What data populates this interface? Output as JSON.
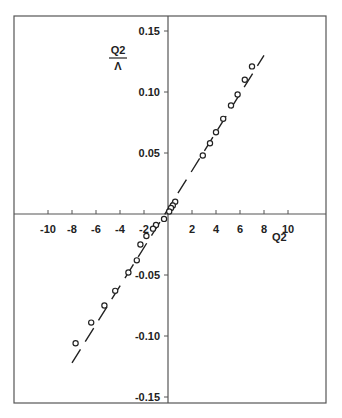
{
  "chart_data": {
    "type": "scatter",
    "title": "",
    "xlabel": "Q2",
    "ylabel": "Q2 / Λ",
    "ylabel_numerator": "Q2",
    "ylabel_denominator": "Λ",
    "xlim": [
      -14,
      13
    ],
    "ylim": [
      -0.155,
      0.165
    ],
    "x_ticks": [
      -10,
      -8,
      -6,
      -4,
      -2,
      2,
      4,
      6,
      8,
      10
    ],
    "x_tick_labels": [
      "-10",
      "-8",
      "-6",
      "-4",
      "-2",
      "2",
      "4",
      "6",
      "8",
      "10"
    ],
    "y_ticks": [
      0.15,
      0.1,
      0.05,
      -0.05,
      -0.1,
      -0.15
    ],
    "y_tick_labels": [
      "0.15",
      "0.10",
      "0.05",
      "-0.05",
      "-0.10",
      "-0.15"
    ],
    "grid": false,
    "legend": null,
    "series": [
      {
        "name": "data",
        "style": "open-circle",
        "x": [
          7.0,
          6.4,
          5.8,
          5.25,
          4.6,
          4.0,
          3.5,
          2.9,
          0.6,
          0.4,
          0.25,
          0.1,
          -0.33,
          -1.0,
          -1.25,
          -1.8,
          -2.3,
          -2.6,
          -3.3,
          -4.4,
          -5.3,
          -6.4,
          -7.7
        ],
        "y": [
          0.121,
          0.11,
          0.098,
          0.089,
          0.078,
          0.067,
          0.058,
          0.048,
          0.01,
          0.007,
          0.005,
          0.002,
          -0.004,
          -0.009,
          -0.012,
          -0.018,
          -0.025,
          -0.038,
          -0.048,
          -0.063,
          -0.075,
          -0.089,
          -0.106
        ]
      },
      {
        "name": "fit",
        "style": "dashed-line",
        "x": [
          -8.0,
          8.0
        ],
        "y": [
          -0.122,
          0.13
        ]
      }
    ]
  }
}
